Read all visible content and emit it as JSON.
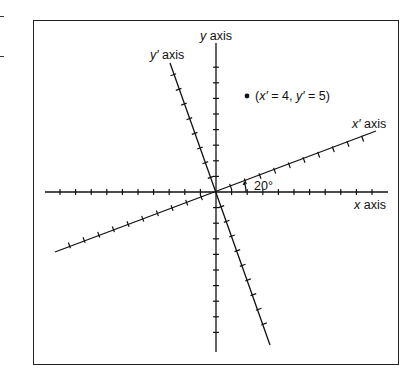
{
  "diagram": {
    "type": "rotated-coordinate-axes",
    "labels": {
      "y_axis": "y axis",
      "y_prime_axis": "y′ axis",
      "x_prime_axis": "x′ axis",
      "x_axis": "x axis",
      "angle": "20°",
      "point": "(x′ = 4, y′ = 5)"
    },
    "label_parts": {
      "y_axis_var": "y",
      "y_axis_word": " axis",
      "y_prime_var": "y′",
      "y_prime_word": " axis",
      "x_prime_var": "x′",
      "x_prime_word": " axis",
      "x_axis_var": "x",
      "x_axis_word": " axis",
      "point_open": "(",
      "point_x": "x′",
      "point_mid1": " = 4, ",
      "point_y": "y′",
      "point_mid2": " = 5)"
    },
    "rotation_degrees": 20,
    "point": {
      "x_prime": 4,
      "y_prime": 5
    },
    "colors": {
      "line": "#111111",
      "frame": "#222222",
      "background": "#ffffff"
    }
  }
}
